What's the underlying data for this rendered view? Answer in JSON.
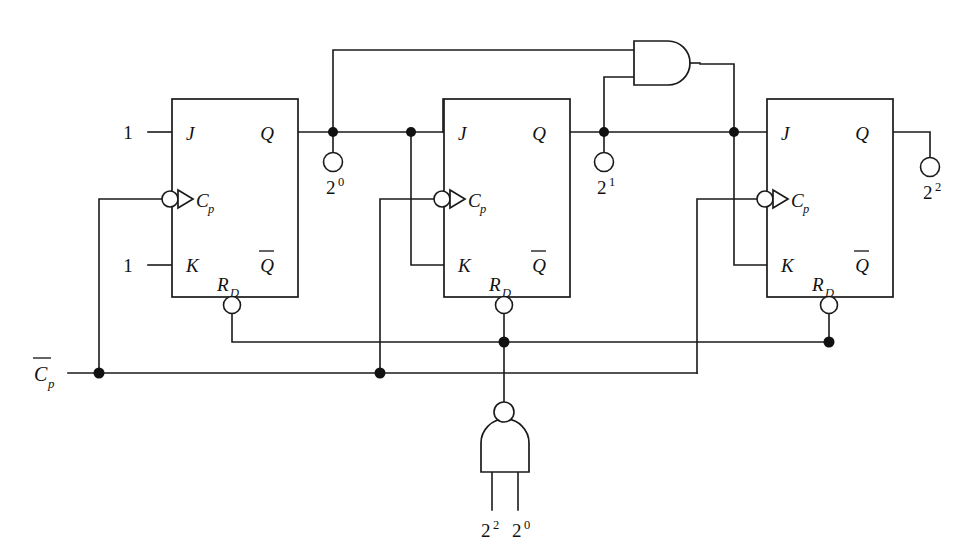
{
  "diagram": {
    "background_color": "#ffffff",
    "line_color": "#1a1a1a"
  },
  "flipflops": [
    {
      "id": "ff0",
      "pins": {
        "j": "J",
        "k": "K",
        "clock": "C",
        "clock_sub": "p",
        "q": "Q",
        "qbar": "Q",
        "reset": "R",
        "reset_sub": "D"
      },
      "inputs": {
        "j_value": "1",
        "k_value": "1"
      },
      "output_label": {
        "base": "2",
        "exponent": "0"
      }
    },
    {
      "id": "ff1",
      "pins": {
        "j": "J",
        "k": "K",
        "clock": "C",
        "clock_sub": "p",
        "q": "Q",
        "qbar": "Q",
        "reset": "R",
        "reset_sub": "D"
      },
      "inputs": {
        "j_value": "",
        "k_value": ""
      },
      "output_label": {
        "base": "2",
        "exponent": "1"
      }
    },
    {
      "id": "ff2",
      "pins": {
        "j": "J",
        "k": "K",
        "clock": "C",
        "clock_sub": "p",
        "q": "Q",
        "qbar": "Q",
        "reset": "R",
        "reset_sub": "D"
      },
      "inputs": {
        "j_value": "",
        "k_value": ""
      },
      "output_label": {
        "base": "2",
        "exponent": "2"
      }
    }
  ],
  "gates": [
    {
      "id": "and-gate",
      "type": "AND",
      "inverted_output": false,
      "inputs": [
        "2^0",
        "2^1"
      ],
      "orientation": "horizontal"
    },
    {
      "id": "nand-gate",
      "type": "NAND",
      "inverted_output": true,
      "inputs": [
        "2^2",
        "2^0"
      ],
      "orientation": "vertical-up",
      "input_labels": [
        {
          "base": "2",
          "exponent": "2"
        },
        {
          "base": "2",
          "exponent": "0"
        }
      ]
    }
  ],
  "signals": {
    "clock_bus": {
      "base": "C",
      "sub": "p",
      "overbar": true
    },
    "high_value": "1",
    "outputs": [
      {
        "base": "2",
        "exponent": "0"
      },
      {
        "base": "2",
        "exponent": "1"
      },
      {
        "base": "2",
        "exponent": "2"
      }
    ]
  }
}
